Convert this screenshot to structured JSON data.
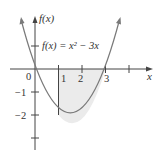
{
  "figure": {
    "function_label": "f(x) = x² − 3x",
    "y_axis_label": "f(x)",
    "x_axis_label": "x",
    "x_tick_labels": [
      "0",
      "1",
      "2",
      "3"
    ],
    "y_tick_labels": [
      "−1",
      "−2"
    ],
    "shaded_region": {
      "from_x": 1,
      "to_x": 3,
      "description": "Region between curve and x-axis from x=1 to x=3"
    },
    "colors": {
      "curve": "#7a7a7a",
      "axes": "#444444",
      "shade": "#ebebeb",
      "text": "#333333"
    }
  }
}
